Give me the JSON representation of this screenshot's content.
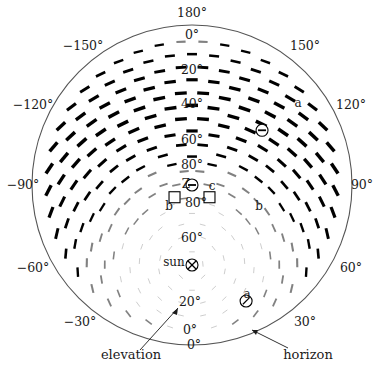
{
  "figure": {
    "colors": {
      "ink": "#1b1b1b",
      "horizon_circle": "#4a4a4a",
      "bar_dark": "#000000",
      "bar_faint": "#b9b9b9"
    }
  },
  "azimuth_axis": {
    "name": "azimuth",
    "unit": "degrees",
    "labels": [
      {
        "text": "180°",
        "deg": 180
      },
      {
        "text": "150°",
        "deg": 150
      },
      {
        "text": "120°",
        "deg": 120
      },
      {
        "text": "90°",
        "deg": 90
      },
      {
        "text": "60°",
        "deg": 60
      },
      {
        "text": "30°",
        "deg": 30
      },
      {
        "text": "0°",
        "deg": 0
      },
      {
        "text": "−30°",
        "deg": -30
      },
      {
        "text": "−60°",
        "deg": -60
      },
      {
        "text": "−90°",
        "deg": -90
      },
      {
        "text": "−120°",
        "deg": -120
      },
      {
        "text": "−150°",
        "deg": -150
      }
    ]
  },
  "elevation_axis": {
    "name": "elevation",
    "unit": "degrees",
    "upper_labels": [
      {
        "text": "0°",
        "deg": 0
      },
      {
        "text": "20°",
        "deg": 20
      },
      {
        "text": "40°",
        "deg": 40
      },
      {
        "text": "60°",
        "deg": 60
      },
      {
        "text": "80°",
        "deg": 80
      }
    ],
    "lower_labels": [
      {
        "text": "80°",
        "deg": 80
      },
      {
        "text": "60°",
        "deg": 60
      },
      {
        "text": "20°",
        "deg": 20
      },
      {
        "text": "0°",
        "deg": 0
      }
    ]
  },
  "callouts": [
    {
      "id": "elevation",
      "text": "elevation"
    },
    {
      "id": "horizon",
      "text": "horizon"
    }
  ],
  "markers": [
    {
      "id": "zenith",
      "label": "Z",
      "suffix": "c",
      "glyph": "circle-bar",
      "azimuth_deg": 0,
      "elevation_deg": 90
    },
    {
      "id": "neutral-point-a-upper",
      "label": "",
      "suffix": "a",
      "glyph": "circle-bar",
      "azimuth_deg": 128,
      "elevation_deg": 40
    },
    {
      "id": "neutral-point-a-lower",
      "label": "",
      "suffix": "a",
      "glyph": "circle-slash",
      "azimuth_deg": 25,
      "elevation_deg": 18
    },
    {
      "id": "neutral-point-b-left",
      "label": "",
      "suffix": "b",
      "glyph": "square",
      "azimuth_deg": -55,
      "elevation_deg": 78
    },
    {
      "id": "neutral-point-b-right",
      "label": "",
      "suffix": "b",
      "glyph": "square",
      "azimuth_deg": 55,
      "elevation_deg": 78
    },
    {
      "id": "sun",
      "label": "sun",
      "suffix": "",
      "glyph": "circle-cross",
      "azimuth_deg": 0,
      "elevation_deg": 45
    }
  ],
  "chart_data": {
    "type": "scatter",
    "xlabel": "azimuth",
    "ylabel": "elevation",
    "grid": false,
    "legend": "none",
    "projection": "polar-zenith-centered",
    "radial_range_deg": [
      0,
      90
    ],
    "angular_range_deg": [
      -180,
      180
    ],
    "sun_position": {
      "azimuth_deg": 0,
      "elevation_deg": 45
    },
    "neutral_points": [
      {
        "name": "a",
        "azimuth_deg": 128,
        "elevation_deg": 40
      },
      {
        "name": "a",
        "azimuth_deg": 25,
        "elevation_deg": 18
      },
      {
        "name": "b",
        "azimuth_deg": -55,
        "elevation_deg": 78
      },
      {
        "name": "b",
        "azimuth_deg": 55,
        "elevation_deg": 78
      },
      {
        "name": "c",
        "azimuth_deg": 0,
        "elevation_deg": 90
      }
    ]
  }
}
